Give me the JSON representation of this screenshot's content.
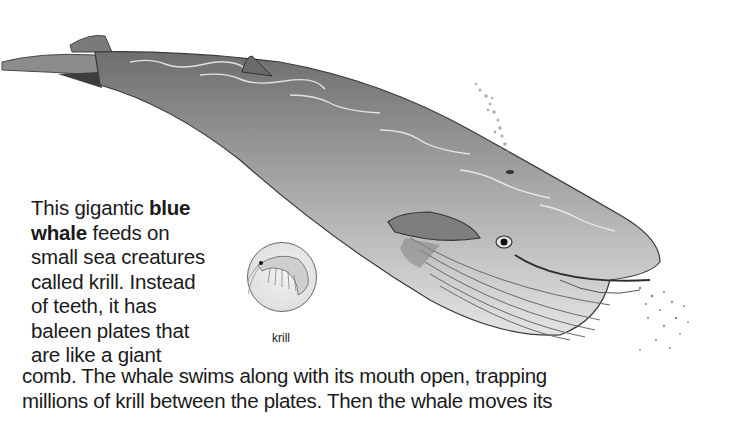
{
  "illustration": {
    "subject": "blue whale",
    "inset_label": "krill",
    "colors": {
      "whale_body": "#8a8a8a",
      "whale_belly": "#d6d6d6",
      "outline": "#3a3a3a",
      "spray": "#9a9a9a"
    }
  },
  "paragraph": {
    "line1_pre": "This gigantic ",
    "line1_bold": "blue",
    "line2_bold": "whale",
    "line2_post": " feeds on",
    "line3": "small sea creatures",
    "line4": "called krill. Instead",
    "line5": "of teeth, it has",
    "line6": "baleen plates that",
    "line7": "are like a giant",
    "line8": "comb. The whale swims along with its mouth open, trapping",
    "line9": "millions of krill between the plates. Then the whale moves its"
  }
}
